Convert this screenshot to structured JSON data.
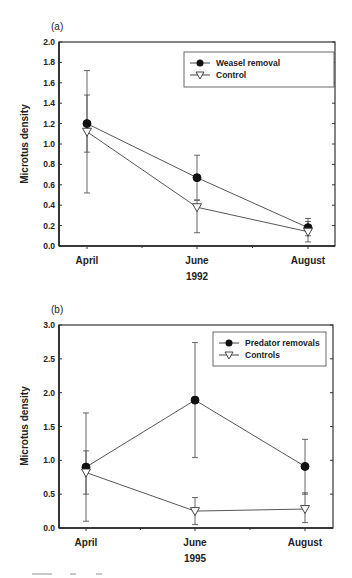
{
  "chart_data": [
    {
      "type": "line",
      "panel_label": "(a)",
      "title": "",
      "xlabel": "1992",
      "ylabel": "Microtus density",
      "categories": [
        "April",
        "June",
        "August"
      ],
      "ylim": [
        0.0,
        2.0
      ],
      "yticks": [
        "0.0",
        "0.2",
        "0.4",
        "0.6",
        "0.8",
        "1.0",
        "1.2",
        "1.4",
        "1.6",
        "1.8",
        "2.0"
      ],
      "grid": false,
      "legend_position": "upper right",
      "series": [
        {
          "name": "Weasel removal",
          "marker": "filled-circle",
          "values": [
            1.2,
            0.67,
            0.18
          ],
          "error_low": [
            0.92,
            0.45,
            0.1
          ],
          "error_high": [
            1.48,
            0.89,
            0.27
          ]
        },
        {
          "name": "Control",
          "marker": "open-triangle-down",
          "values": [
            1.12,
            0.38,
            0.14
          ],
          "error_low": [
            0.52,
            0.13,
            0.04
          ],
          "error_high": [
            1.72,
            0.45,
            0.24
          ]
        }
      ]
    },
    {
      "type": "line",
      "panel_label": "(b)",
      "title": "",
      "xlabel": "1995",
      "ylabel": "Microtus density",
      "categories": [
        "April",
        "June",
        "August"
      ],
      "ylim": [
        0.0,
        3.0
      ],
      "yticks": [
        "0.0",
        "0.5",
        "1.0",
        "1.5",
        "2.0",
        "2.5",
        "3.0"
      ],
      "grid": false,
      "legend_position": "upper right",
      "series": [
        {
          "name": "Predator removals",
          "marker": "filled-circle",
          "values": [
            0.9,
            1.89,
            0.91
          ],
          "error_low": [
            0.5,
            1.04,
            0.5
          ],
          "error_high": [
            1.14,
            2.74,
            1.31
          ]
        },
        {
          "name": "Controls",
          "marker": "open-triangle-down",
          "values": [
            0.82,
            0.25,
            0.28
          ],
          "error_low": [
            0.1,
            0.05,
            0.08
          ],
          "error_high": [
            1.7,
            0.45,
            0.52
          ]
        }
      ]
    }
  ]
}
